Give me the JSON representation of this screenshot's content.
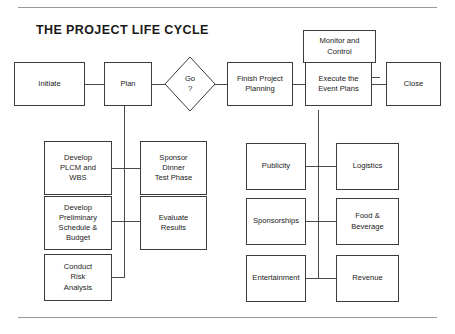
{
  "title": "THE PROJECT LIFE CYCLE",
  "theme": {
    "background": "#ffffff",
    "box_border": "#3c3c3c",
    "connector": "#4a4a4a",
    "rule": "#9a9a9a",
    "text": "#1a1a1a"
  },
  "diagram": {
    "type": "flowchart",
    "orientation": "left-to-right with vertical sub-branches",
    "phases": [
      {
        "id": "initiate",
        "label": "Initiate",
        "shape": "rectangle",
        "row": "top"
      },
      {
        "id": "plan",
        "label": "Plan",
        "shape": "rectangle",
        "row": "top"
      },
      {
        "id": "go",
        "label_line1": "Go",
        "label_line2": "?",
        "shape": "diamond",
        "row": "top"
      },
      {
        "id": "finish-project-planning",
        "label": "Finish Project\nPlanning",
        "shape": "rectangle",
        "row": "top"
      },
      {
        "id": "execute-the-event-plans",
        "label": "Execute the\nEvent Plans",
        "shape": "rectangle",
        "row": "top"
      },
      {
        "id": "monitor-and-control",
        "label": "Monitor and\nControl",
        "shape": "rectangle",
        "row": "above-top"
      },
      {
        "id": "close",
        "label": "Close",
        "shape": "rectangle",
        "row": "top"
      }
    ],
    "plan_subtasks_left": [
      {
        "id": "develop-plcm-and-wbs",
        "label": "Develop\nPLCM and\nWBS"
      },
      {
        "id": "develop-preliminary-schedule-budget",
        "label": "Develop\nPreliminary\nSchedule &\nBudget"
      },
      {
        "id": "conduct-risk-analysis",
        "label": "Conduct\nRisk\nAnalysis"
      }
    ],
    "plan_subtasks_right": [
      {
        "id": "sponsor-dinner-test-phase",
        "label": "Sponsor\nDinner\nTest Phase"
      },
      {
        "id": "evaluate-results",
        "label": "Evaluate\nResults"
      }
    ],
    "execute_subtasks_left": [
      {
        "id": "publicity",
        "label": "Publicity"
      },
      {
        "id": "sponsorships",
        "label": "Sponsorships"
      },
      {
        "id": "entertainment",
        "label": "Entertainment"
      }
    ],
    "execute_subtasks_right": [
      {
        "id": "logistics",
        "label": "Logistics"
      },
      {
        "id": "food-beverage",
        "label": "Food &\nBeverage"
      },
      {
        "id": "revenue",
        "label": "Revenue"
      }
    ]
  }
}
